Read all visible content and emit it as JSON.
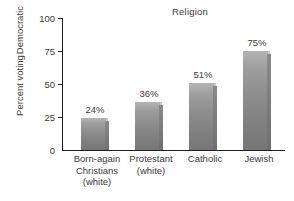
{
  "chart_data": {
    "type": "bar",
    "title": "Religion",
    "xlabel": "",
    "ylabel": "Percent voting Democratic",
    "ylabel_lines": [
      "Percent voting",
      "Democratic"
    ],
    "ylim": [
      0,
      100
    ],
    "yticks": [
      0,
      25,
      50,
      75,
      100
    ],
    "ytick_labels": [
      "0",
      "25",
      "50",
      "75",
      "100"
    ],
    "grid": false,
    "legend": false,
    "categories": [
      "Born-again Christians (white)",
      "Protestant (white)",
      "Catholic",
      "Jewish"
    ],
    "category_lines": [
      [
        "Born-again",
        "Christians",
        "(white)"
      ],
      [
        "Protestant",
        "(white)"
      ],
      [
        "Catholic"
      ],
      [
        "Jewish"
      ]
    ],
    "values": [
      24,
      36,
      51,
      75
    ],
    "value_labels": [
      "24%",
      "36%",
      "51%",
      "75%"
    ],
    "colors": {
      "bar_front_light": "#b4b4b4",
      "bar_front_dark": "#777777",
      "bar_side": "#7a7a7a",
      "bar_top": "#c6c6c6",
      "axis": "#1e1e1e",
      "text": "#3a3a3a",
      "background": "#ffffff"
    }
  }
}
